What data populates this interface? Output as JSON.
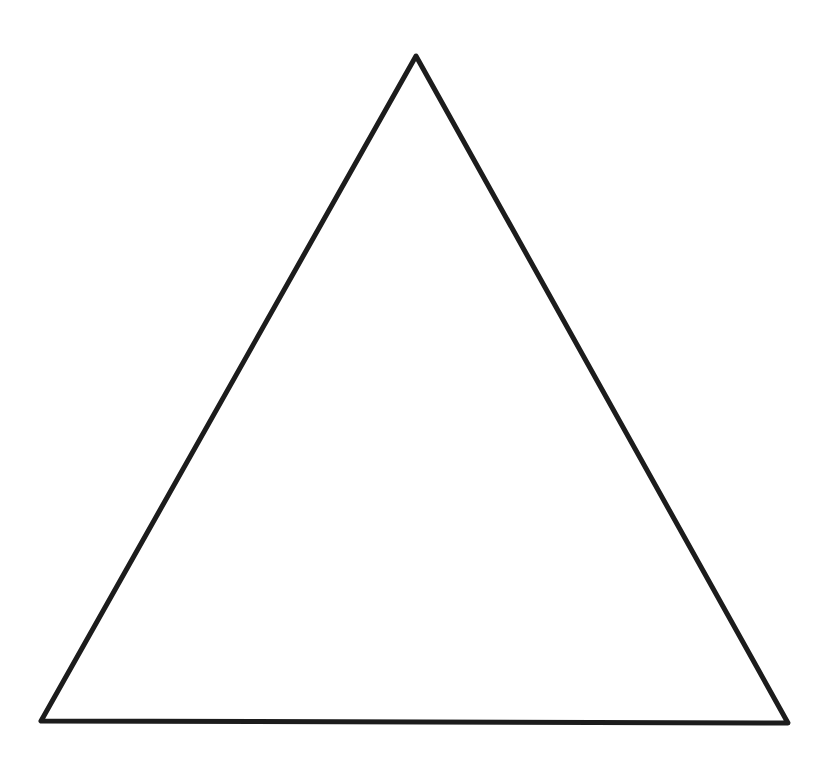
{
  "figure": {
    "shape": "triangle",
    "kind": "equilateral-outline",
    "vertices": {
      "top": [
        416,
        56
      ],
      "bottom_left": [
        41,
        721
      ],
      "bottom_right": [
        788,
        723
      ]
    },
    "stroke_color": "#1c1c1c",
    "stroke_width": 5,
    "fill": "#ffffff"
  },
  "background_color": "#ffffff"
}
